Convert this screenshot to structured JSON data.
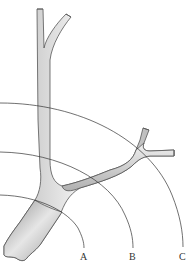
{
  "diagram": {
    "colors": {
      "vessel_fill_light": "#efefef",
      "vessel_fill_dark": "#9a9a9a",
      "vessel_outline": "#555555",
      "arc_stroke": "#333333",
      "background": "#ffffff"
    },
    "arcs": [
      {
        "id": "A",
        "label": "A"
      },
      {
        "id": "B",
        "label": "B"
      },
      {
        "id": "C",
        "label": "C"
      }
    ]
  }
}
